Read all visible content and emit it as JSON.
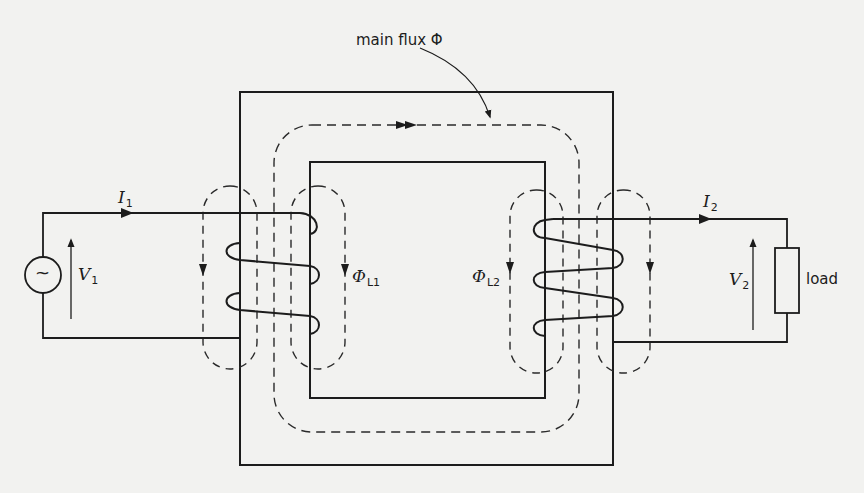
{
  "diagram": {
    "type": "transformer-flux-diagram",
    "labels": {
      "main_flux": "main flux Φ",
      "primary_current": "I",
      "primary_current_sub": "1",
      "secondary_current": "I",
      "secondary_current_sub": "2",
      "primary_voltage": "V",
      "primary_voltage_sub": "1",
      "secondary_voltage": "V",
      "secondary_voltage_sub": "2",
      "leakage_flux_1": "Φ",
      "leakage_flux_1_sub": "L1",
      "leakage_flux_2": "Φ",
      "leakage_flux_2_sub": "L2",
      "load": "load",
      "source_symbol": "~"
    },
    "components": {
      "source": "ac-voltage-source",
      "core": "rectangular-iron-core",
      "primary_winding_turns": 3,
      "secondary_winding_turns": 3,
      "load": "resistive-load"
    },
    "colors": {
      "ink": "#1c1c1c",
      "dashed": "#2a2a2a",
      "paper": "#f2f2f0"
    }
  }
}
